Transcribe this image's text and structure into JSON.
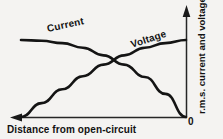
{
  "chart_data": {
    "type": "line",
    "title": "",
    "xlabel": "Distance from open-circuit",
    "ylabel": "r.m.s. current and voltage",
    "origin_label": "0",
    "grid": false,
    "legend": "inline-curve-labels",
    "axis_direction_note": "x increases leftwards from open-circuit at right; arrow points left",
    "xlim": [
      0,
      1
    ],
    "ylim": [
      0,
      1
    ],
    "series": [
      {
        "name": "Current",
        "label": "Current",
        "color": "#141414",
        "x": [
          0.0,
          0.125,
          0.25,
          0.375,
          0.5,
          0.625,
          0.75,
          0.875,
          1.0
        ],
        "values": [
          1.0,
          0.99,
          0.96,
          0.9,
          0.8,
          0.68,
          0.52,
          0.3,
          0.0
        ]
      },
      {
        "name": "Voltage",
        "label": "Voltage",
        "color": "#141414",
        "x": [
          0.0,
          0.125,
          0.25,
          0.375,
          0.5,
          0.625,
          0.75,
          0.875,
          1.0
        ],
        "values": [
          0.0,
          0.18,
          0.36,
          0.53,
          0.68,
          0.8,
          0.9,
          0.96,
          1.0
        ]
      }
    ]
  },
  "figure": {
    "background": "#f4f3f1",
    "ink": "#141414",
    "x_axis": {
      "label": "Distance from open-circuit",
      "arrow": "left-arrow-head"
    },
    "y_axis": {
      "label": "r.m.s. current and voltage",
      "arrow": "up-arrow-head",
      "zero_tick": "0"
    }
  }
}
